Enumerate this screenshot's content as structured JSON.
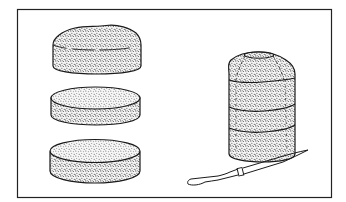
{
  "figure": {
    "description": "Line illustration showing three cake layers separately (domed top layer and two flat layers) and the same layers assembled into a stacked cake, with a knife below",
    "colors": {
      "background": "#ffffff",
      "frame": "#222222",
      "outline": "#1a1a1a",
      "stipple": "#3a3a3a",
      "fill": "#f3f3f3"
    },
    "elements": {
      "frame": "frame-border",
      "separate_layers": [
        "domed-top-layer",
        "middle-flat-layer",
        "bottom-flat-layer"
      ],
      "assembled_cake": "stacked-cake",
      "tool": "knife"
    }
  }
}
